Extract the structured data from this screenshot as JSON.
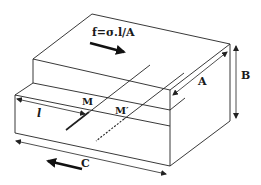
{
  "diagram": {
    "labels": {
      "force": "f=σ.l/A",
      "A": "A",
      "B": "B",
      "C": "C",
      "l": "l",
      "M": "M",
      "M_prime": "M′"
    },
    "colors": {
      "stroke": "#222222",
      "background": "#ffffff"
    },
    "arrows": {
      "force_direction": "right-down (upper block shear)",
      "lower_direction": "left-down (lower block shear)"
    }
  }
}
